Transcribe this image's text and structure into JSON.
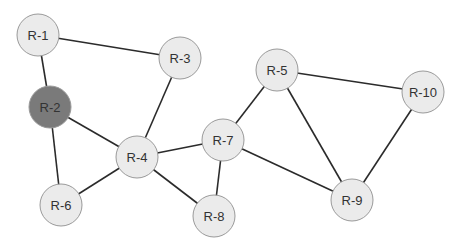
{
  "diagram": {
    "type": "network-topology",
    "colors": {
      "node_default": "#ebebeb",
      "node_highlighted": "#7a7a7a",
      "edge": "#2b2b2b"
    },
    "nodes": [
      {
        "id": "R-1",
        "label": "R-1",
        "highlighted": false
      },
      {
        "id": "R-2",
        "label": "R-2",
        "highlighted": true
      },
      {
        "id": "R-3",
        "label": "R-3",
        "highlighted": false
      },
      {
        "id": "R-4",
        "label": "R-4",
        "highlighted": false
      },
      {
        "id": "R-5",
        "label": "R-5",
        "highlighted": false
      },
      {
        "id": "R-6",
        "label": "R-6",
        "highlighted": false
      },
      {
        "id": "R-7",
        "label": "R-7",
        "highlighted": false
      },
      {
        "id": "R-8",
        "label": "R-8",
        "highlighted": false
      },
      {
        "id": "R-9",
        "label": "R-9",
        "highlighted": false
      },
      {
        "id": "R-10",
        "label": "R-10",
        "highlighted": false
      }
    ],
    "edges": [
      [
        "R-1",
        "R-2"
      ],
      [
        "R-1",
        "R-3"
      ],
      [
        "R-2",
        "R-4"
      ],
      [
        "R-2",
        "R-6"
      ],
      [
        "R-3",
        "R-4"
      ],
      [
        "R-4",
        "R-6"
      ],
      [
        "R-4",
        "R-7"
      ],
      [
        "R-4",
        "R-8"
      ],
      [
        "R-7",
        "R-8"
      ],
      [
        "R-5",
        "R-7"
      ],
      [
        "R-5",
        "R-9"
      ],
      [
        "R-5",
        "R-10"
      ],
      [
        "R-7",
        "R-9"
      ],
      [
        "R-9",
        "R-10"
      ]
    ]
  }
}
